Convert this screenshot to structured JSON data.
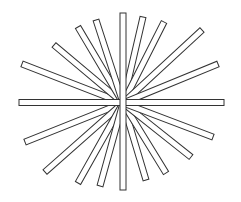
{
  "figure": {
    "width": 241,
    "height": 202,
    "background": "#ffffff",
    "stroke_color": "#333333",
    "fill_color": "#ffffff",
    "bar_width": 6,
    "center": [
      123,
      103
    ]
  },
  "bars": [
    {
      "id": "horizontal",
      "x1": 19,
      "y1": 102.5,
      "x2": 224,
      "y2": 102.5
    },
    {
      "id": "vertical",
      "x1": 123,
      "y1": 13,
      "x2": 123,
      "y2": 190
    },
    {
      "id": "upper-left-1",
      "x1": 22,
      "y1": 64,
      "x2": 123,
      "y2": 103
    },
    {
      "id": "upper-left-2",
      "x1": 54,
      "y1": 45,
      "x2": 123,
      "y2": 103
    },
    {
      "id": "upper-left-3",
      "x1": 78,
      "y1": 27,
      "x2": 123,
      "y2": 103
    },
    {
      "id": "upper-left-4",
      "x1": 96,
      "y1": 20,
      "x2": 123,
      "y2": 103
    },
    {
      "id": "upper-right-1",
      "x1": 143,
      "y1": 17,
      "x2": 123,
      "y2": 103
    },
    {
      "id": "upper-right-2",
      "x1": 164,
      "y1": 22,
      "x2": 123,
      "y2": 103
    },
    {
      "id": "upper-right-3",
      "x1": 202,
      "y1": 30,
      "x2": 123,
      "y2": 103
    },
    {
      "id": "upper-right-4",
      "x1": 218,
      "y1": 64,
      "x2": 123,
      "y2": 103
    },
    {
      "id": "lower-left-1",
      "x1": 25,
      "y1": 142,
      "x2": 123,
      "y2": 103
    },
    {
      "id": "lower-left-2",
      "x1": 45,
      "y1": 172,
      "x2": 123,
      "y2": 103
    },
    {
      "id": "lower-left-3",
      "x1": 78,
      "y1": 183,
      "x2": 123,
      "y2": 103
    },
    {
      "id": "lower-left-4",
      "x1": 100,
      "y1": 186,
      "x2": 123,
      "y2": 103
    },
    {
      "id": "lower-right-1",
      "x1": 146,
      "y1": 180,
      "x2": 123,
      "y2": 103
    },
    {
      "id": "lower-right-2",
      "x1": 166,
      "y1": 173,
      "x2": 123,
      "y2": 103
    },
    {
      "id": "lower-right-3",
      "x1": 191,
      "y1": 157,
      "x2": 123,
      "y2": 103
    },
    {
      "id": "lower-right-4",
      "x1": 213,
      "y1": 137,
      "x2": 123,
      "y2": 103
    }
  ]
}
